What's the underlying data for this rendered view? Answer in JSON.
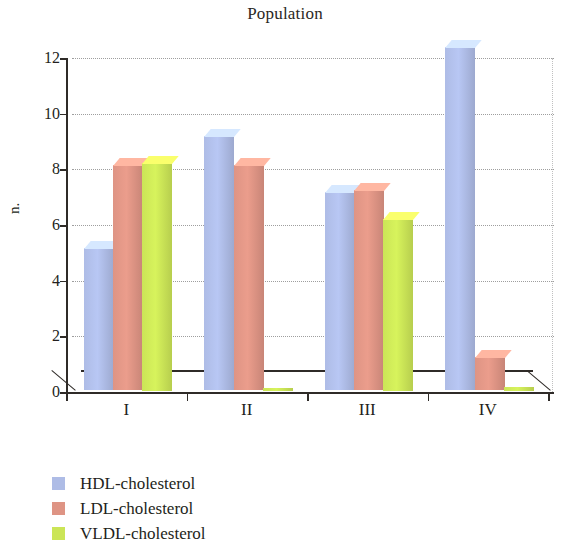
{
  "chart_data": {
    "type": "bar",
    "title": "Population",
    "xlabel": "",
    "ylabel": "n.",
    "categories": [
      "I",
      "II",
      "III",
      "IV"
    ],
    "ylim": [
      0,
      12
    ],
    "yticks": [
      0,
      2,
      4,
      6,
      8,
      10,
      12
    ],
    "grid": true,
    "legend_position": "bottom-left",
    "style": "3d-column",
    "series": [
      {
        "name": "HDL-cholesterol",
        "color": "#aebce6",
        "values": [
          5.1,
          9.1,
          7.1,
          12.3
        ]
      },
      {
        "name": "LDL-cholesterol",
        "color": "#de9484",
        "values": [
          8.1,
          8.1,
          7.2,
          1.2
        ]
      },
      {
        "name": "VLDL-cholesterol",
        "color": "#cbe557",
        "values": [
          8.2,
          0.1,
          6.2,
          0.15
        ]
      }
    ]
  }
}
